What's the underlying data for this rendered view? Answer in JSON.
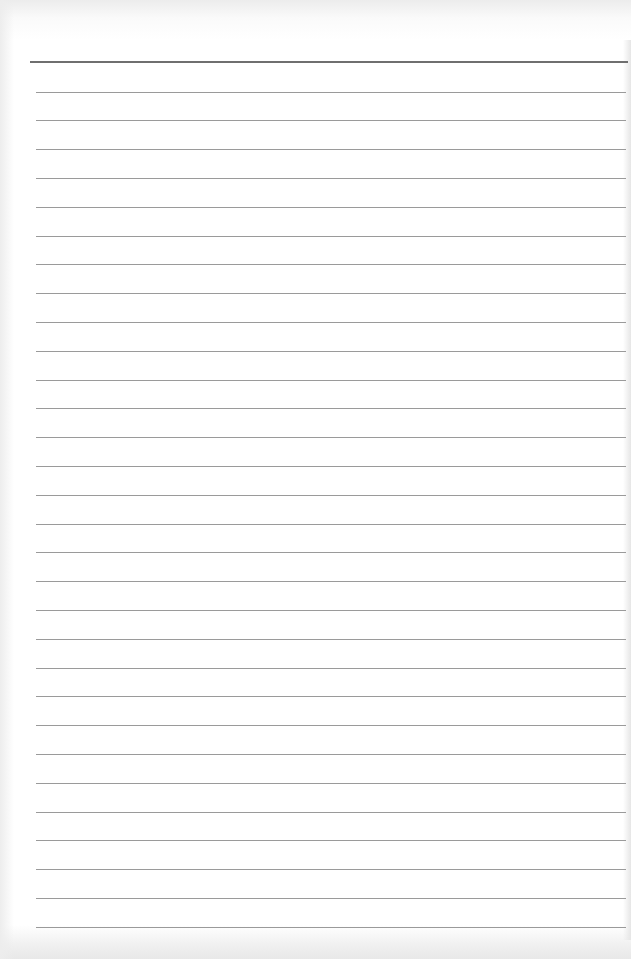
{
  "document": {
    "type": "lined-paper",
    "header_rule": {
      "y": 61,
      "color": "#6f6f6f",
      "thickness": 2
    },
    "lines": {
      "count": 30,
      "first_y": 91.5,
      "spacing": 28.8,
      "color": "#9a9a9a",
      "x_start": 36,
      "x_end": 626
    },
    "background_color": "#ffffff",
    "content": []
  }
}
